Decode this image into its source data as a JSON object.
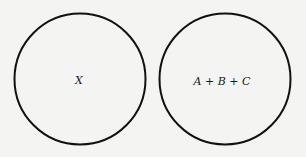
{
  "diagram": {
    "circles": [
      {
        "label": "X",
        "cx": 80,
        "cy": 79,
        "r": 66
      },
      {
        "label": "A + B + C",
        "cx": 225,
        "cy": 79,
        "r": 66
      }
    ],
    "stroke_color": "#111111",
    "background": "#f4f4f2"
  }
}
